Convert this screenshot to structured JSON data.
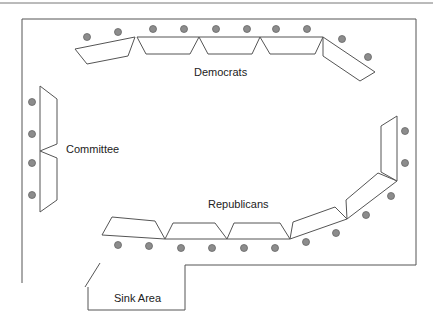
{
  "diagram": {
    "type": "floor-plan",
    "labels": {
      "democrats": "Democrats",
      "committee": "Committee",
      "republicans": "Republicans",
      "sink_area": "Sink Area"
    },
    "colors": {
      "lines": "#555555",
      "seats": "#8c8c8c",
      "background": "#ffffff"
    },
    "seat_counts": {
      "democrats": 10,
      "committee": 4,
      "republicans": 13
    }
  }
}
